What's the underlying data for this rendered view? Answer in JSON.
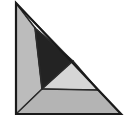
{
  "figure": {
    "canvas": {
      "width": 130,
      "height": 122
    },
    "background_color": "#ffffff",
    "outline_color": "#1a1a1a",
    "outline_width": 2.2,
    "inner_edge_color": "#2b2b2b",
    "inner_edge_width": 1.6,
    "vertices": {
      "apex": [
        16,
        3
      ],
      "bottom_left": [
        16,
        114
      ],
      "bottom_right": [
        121,
        114
      ],
      "dark_top": [
        35,
        28
      ],
      "dark_right": [
        73,
        61
      ],
      "dark_bottom": [
        42,
        89
      ],
      "mid_right_on_hyp": [
        98,
        90
      ]
    },
    "outer_triangle": {
      "name": "outer-right-triangle",
      "points": "16,3 121,114 16,114",
      "fill": "none",
      "description": "Overall right triangle with vertical left leg, horizontal bottom leg, hypotenuse from top-left apex to bottom-right"
    },
    "pieces": [
      {
        "id": "left-light-triangle",
        "label": "Left light gray triangle",
        "points": "16,3 35,28 42,89 16,114",
        "fill": "#bcbcbc",
        "stroke": "#2b2b2b"
      },
      {
        "id": "dark-triangle",
        "label": "Dark near-black triangle",
        "points": "35,28 73,61 42,89",
        "fill": "#232323",
        "stroke": "#232323"
      },
      {
        "id": "mid-light-triangle",
        "label": "Middle pale gray triangle",
        "points": "42,89 73,61 98,90",
        "fill": "#d6d6d6",
        "stroke": "#2b2b2b"
      },
      {
        "id": "bottom-trapezoid",
        "label": "Bottom gray trapezoid",
        "points": "42,89 98,90 121,114 16,114",
        "fill": "#b4b4b4",
        "stroke": "#2b2b2b"
      },
      {
        "id": "upper-white-triangle",
        "label": "Upper white triangle",
        "points": "16,3 73,61 35,28",
        "fill": "#ffffff",
        "stroke": "#2b2b2b"
      },
      {
        "id": "right-white-triangle",
        "label": "Right white triangle",
        "points": "73,61 98,90 121,114",
        "fill": "#ffffff",
        "stroke": "none"
      }
    ],
    "inner_edges": [
      {
        "id": "edge-apex-to-dark-top",
        "x1": 16,
        "y1": 3,
        "x2": 35,
        "y2": 28
      },
      {
        "id": "edge-dark-top-to-dark-right",
        "x1": 35,
        "y1": 28,
        "x2": 73,
        "y2": 61
      },
      {
        "id": "edge-dark-top-to-dark-bottom",
        "x1": 35,
        "y1": 28,
        "x2": 42,
        "y2": 89
      },
      {
        "id": "edge-dark-right-to-dark-bottom",
        "x1": 73,
        "y1": 61,
        "x2": 42,
        "y2": 89
      },
      {
        "id": "edge-dark-right-to-mid-right",
        "x1": 73,
        "y1": 61,
        "x2": 98,
        "y2": 90
      },
      {
        "id": "edge-horizontal-base-divider",
        "x1": 42,
        "y1": 89,
        "x2": 98,
        "y2": 90
      },
      {
        "id": "edge-dark-bottom-to-bottom-left",
        "x1": 42,
        "y1": 89,
        "x2": 16,
        "y2": 114
      }
    ]
  }
}
